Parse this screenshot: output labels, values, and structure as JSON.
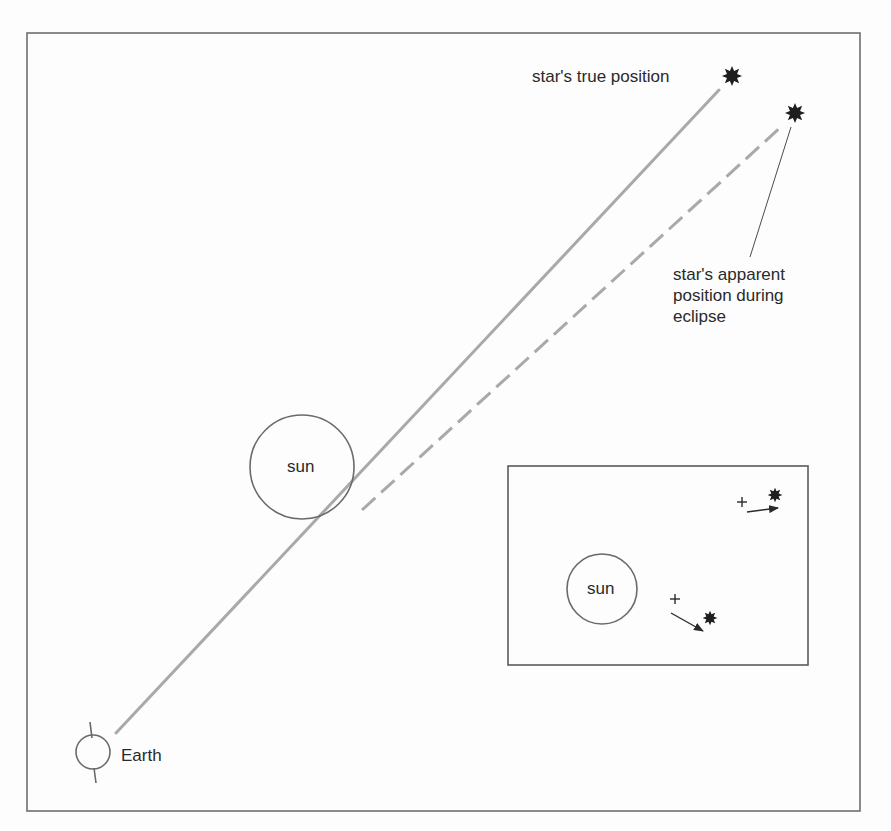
{
  "figure": {
    "colors": {
      "background": "#fdfdfd",
      "frame": "#6e6e6e",
      "ray_line": "#a9a9a9",
      "outline": "#6a6a6a",
      "star": "#1e1e1e",
      "text": "#2a2a2a"
    },
    "labels": {
      "true_position": "star's true position",
      "apparent_position_line1": "star's apparent",
      "apparent_position_line2": "position during",
      "apparent_position_line3": "eclipse",
      "sun_main": "sun",
      "sun_inset": "sun",
      "earth": "Earth"
    },
    "elements": {
      "frame": {
        "x1": 27,
        "y1": 33,
        "x2": 860,
        "y2": 811
      },
      "earth": {
        "cx": 93,
        "cy": 752,
        "r": 17
      },
      "sun_main": {
        "cx": 302,
        "cy": 467,
        "r": 52
      },
      "true_ray": {
        "from": [
          116,
          733
        ],
        "to": [
          719,
          90
        ],
        "style": "solid"
      },
      "apparent_ray": {
        "from": [
          362,
          510
        ],
        "to": [
          783,
          125
        ],
        "style": "dashed"
      },
      "true_star": {
        "cx": 732,
        "cy": 76
      },
      "apparent_star": {
        "cx": 795,
        "cy": 113
      },
      "leader_line": {
        "from": [
          791,
          127
        ],
        "to": [
          750,
          257
        ]
      },
      "inset_box": {
        "x1": 508,
        "y1": 466,
        "x2": 808,
        "y2": 665
      },
      "inset_sun": {
        "cx": 602,
        "cy": 589,
        "r": 35
      },
      "inset_pairs": [
        {
          "true_mark": [
            742,
            502
          ],
          "apparent_star": [
            775,
            495
          ],
          "arrow_from": [
            747,
            512
          ],
          "arrow_to": [
            778,
            508
          ]
        },
        {
          "true_mark": [
            675,
            599
          ],
          "apparent_star": [
            710,
            618
          ],
          "arrow_from": [
            671,
            613
          ],
          "arrow_to": [
            703,
            631
          ]
        }
      ]
    },
    "icons": {
      "star": "eight-point-star-icon",
      "true_position_marker": "plus-icon",
      "displacement": "arrow-icon"
    }
  }
}
